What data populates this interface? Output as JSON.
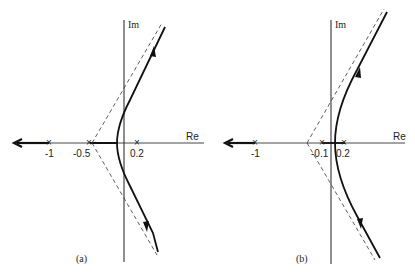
{
  "figure": {
    "panels": [
      {
        "id": "a",
        "caption": "(a)",
        "axis_labels": {
          "real": "Re",
          "imag": "Im"
        },
        "ticks": [
          {
            "label": "-1",
            "value": -1
          },
          {
            "label": "-0.5",
            "value": -0.5
          },
          {
            "label": "0.2",
            "value": 0.2
          }
        ],
        "poles": [
          -1,
          -0.5,
          0.2
        ],
        "asymptote_centroid": -0.43,
        "description": "Root locus with branches leaving the real axis between -0.5 and 0.2, crossing the imaginary axis and approaching ±60° asymptotes; one branch to -infinity along the real axis"
      },
      {
        "id": "b",
        "caption": "(b)",
        "axis_labels": {
          "real": "Re",
          "imag": "Im"
        },
        "ticks": [
          {
            "label": "-1",
            "value": -1
          },
          {
            "label": "-0.1",
            "value": -0.1
          },
          {
            "label": "0.2",
            "value": 0.2
          }
        ],
        "poles": [
          -1,
          -0.1,
          0.2
        ],
        "asymptote_centroid": -0.3,
        "description": "Root locus with branches breaking away in the right half-plane between -0.1 and 0.2, staying in the right half-plane along ±60° asymptotes; one branch to -infinity along the real axis"
      }
    ],
    "colors": {
      "ink": "#222222",
      "background": "#ffffff"
    }
  }
}
